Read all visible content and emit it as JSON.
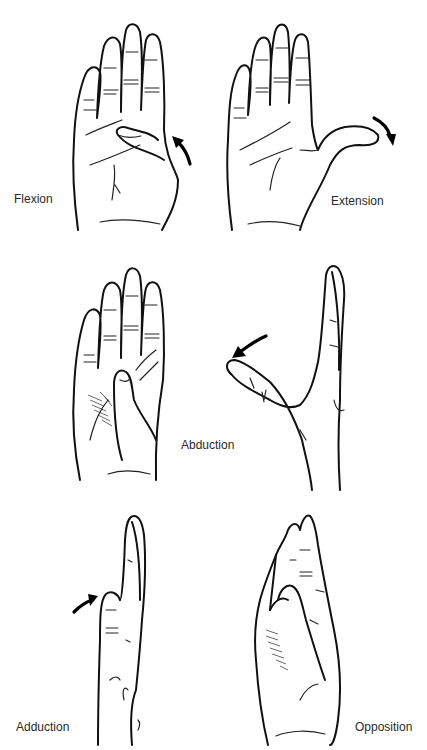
{
  "figure": {
    "panels": [
      {
        "id": "flexion",
        "label": "Flexion",
        "arrow_direction": "up-left"
      },
      {
        "id": "extension",
        "label": "Extension",
        "arrow_direction": "down-right"
      },
      {
        "id": "abduction-palm",
        "label": "",
        "arrow_direction": ""
      },
      {
        "id": "abduction",
        "label": "Abduction",
        "arrow_direction": "down-left"
      },
      {
        "id": "adduction",
        "label": "Adduction",
        "arrow_direction": "right"
      },
      {
        "id": "opposition",
        "label": "Opposition",
        "arrow_direction": ""
      }
    ]
  },
  "colors": {
    "line": "#111111",
    "background": "#ffffff",
    "label": "#2a2a2a"
  }
}
